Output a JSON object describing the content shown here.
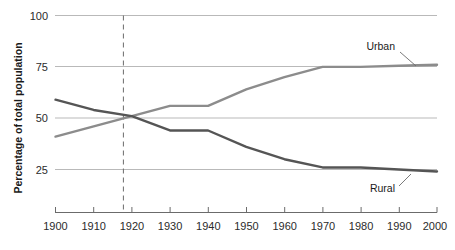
{
  "chart_data": {
    "type": "line",
    "title": "",
    "subtitle": "",
    "xlabel": "",
    "ylabel": "Percentage of total population",
    "xlim": [
      1900,
      2000
    ],
    "ylim": [
      0,
      100
    ],
    "grid": true,
    "grid_axis": "y",
    "legend_position": "inline-annotation",
    "y_ticks": [
      25,
      50,
      75,
      100
    ],
    "y_tick_labels": [
      "25",
      "50",
      "75",
      "100"
    ],
    "x": [
      1900,
      1910,
      1920,
      1930,
      1940,
      1950,
      1960,
      1970,
      1980,
      1990,
      2000
    ],
    "x_tick_labels": [
      "1900",
      "1910",
      "1920",
      "1930",
      "1940",
      "1950",
      "1960",
      "1970",
      "1980",
      "1990",
      "2000"
    ],
    "series": [
      {
        "name": "Urban",
        "color": "#8c8c8c",
        "values": [
          41,
          46,
          51,
          56,
          56,
          64,
          70,
          75,
          75,
          75.5,
          76
        ]
      },
      {
        "name": "Rural",
        "color": "#555555",
        "values": [
          59,
          54,
          51,
          44,
          44,
          36,
          30,
          26,
          26,
          25,
          24
        ]
      }
    ],
    "annotations": [
      {
        "name": "reference-line-1920",
        "type": "vertical-dashed-line",
        "x": 1920,
        "label": "1920",
        "color": "#6b6b6b"
      },
      {
        "name": "urban-series-label",
        "type": "series-callout",
        "text": "Urban",
        "series": "Urban"
      },
      {
        "name": "rural-series-label",
        "type": "series-callout",
        "text": "Rural",
        "series": "Rural"
      }
    ],
    "colors": {
      "background": "#ffffff",
      "gridline": "#b9b9b9",
      "axis": "#6b6b6b",
      "text": "#1a1a1a",
      "urban": "#8c8c8c",
      "rural": "#555555",
      "dashed_reference": "#6b6b6b"
    }
  }
}
